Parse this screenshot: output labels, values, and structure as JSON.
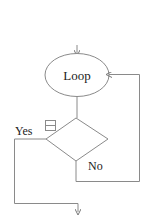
{
  "diagram": {
    "type": "flowchart",
    "nodes": {
      "loop": {
        "shape": "ellipse",
        "label": "Loop"
      },
      "decision": {
        "shape": "diamond",
        "label": ""
      }
    },
    "edge_labels": {
      "yes": "Yes",
      "no": "No"
    },
    "icons": {
      "decision_marker": "collapse-box-icon"
    },
    "colors": {
      "stroke": "#8a8a8a",
      "text": "#222222",
      "background": "#ffffff"
    }
  }
}
